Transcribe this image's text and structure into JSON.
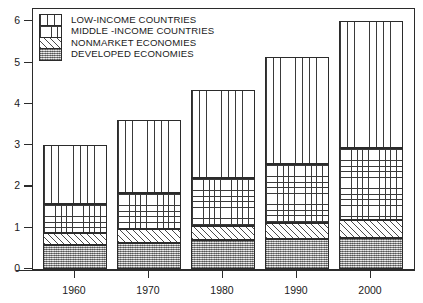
{
  "chart_data": {
    "type": "bar",
    "stacked": true,
    "title": "",
    "xlabel": "",
    "ylabel": "",
    "categories": [
      "1960",
      "1970",
      "1980",
      "1990",
      "2000"
    ],
    "ylim": [
      0,
      6.3
    ],
    "yticks": [
      0,
      1,
      2,
      3,
      4,
      5,
      6
    ],
    "ytick_labels": [
      "0",
      "1",
      "2",
      "3",
      "4",
      "5",
      "6"
    ],
    "grid": false,
    "legend_position": "top-left",
    "series": [
      {
        "name": "DEVELOPED ECONOMIES",
        "pattern": "stipple",
        "values": [
          0.58,
          0.62,
          0.7,
          0.73,
          0.75
        ]
      },
      {
        "name": "NONMARKET ECONOMIES",
        "pattern": "diagonal-hatch",
        "values": [
          0.3,
          0.36,
          0.35,
          0.39,
          0.43
        ]
      },
      {
        "name": "MIDDLE-INCOME COUNTRIES",
        "pattern": "grid",
        "values": [
          0.69,
          0.87,
          1.15,
          1.42,
          1.75
        ]
      },
      {
        "name": "LOW-INCOME COUNTRIES",
        "pattern": "vertical-lines",
        "values": [
          1.44,
          1.77,
          2.15,
          2.59,
          3.09
        ]
      }
    ],
    "stack_tops": {
      "1960": [
        0.58,
        0.88,
        1.57,
        3.01
      ],
      "1970": [
        0.62,
        0.98,
        1.85,
        3.62
      ],
      "1980": [
        0.7,
        1.05,
        2.2,
        4.35
      ],
      "1990": [
        0.73,
        1.12,
        2.54,
        5.13
      ],
      "2000": [
        0.75,
        1.18,
        2.93,
        6.02
      ]
    },
    "totals": [
      3.01,
      3.62,
      4.35,
      5.13,
      6.02
    ]
  },
  "legend": {
    "items": [
      {
        "label": "LOW-INCOME COUNTRIES",
        "pattern": "vertical-lines"
      },
      {
        "label": "MIDDLE -INCOME COUNTRIES",
        "pattern": "grid"
      },
      {
        "label": "NONMARKET ECONOMIES",
        "pattern": "diagonal-hatch"
      },
      {
        "label": "DEVELOPED ECONOMIES",
        "pattern": "stipple"
      }
    ]
  },
  "colors": {
    "axis": "#2b2b2b",
    "text": "#1a1a1a",
    "background": "#ffffff",
    "developed_fill": "#b5b5b5"
  }
}
